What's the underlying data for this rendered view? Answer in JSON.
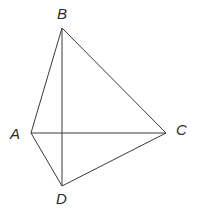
{
  "diagram": {
    "type": "geometry-figure",
    "vertices": [
      {
        "id": "A",
        "label": "A"
      },
      {
        "id": "B",
        "label": "B"
      },
      {
        "id": "C",
        "label": "C"
      },
      {
        "id": "D",
        "label": "D"
      }
    ],
    "edges": [
      {
        "from": "A",
        "to": "B"
      },
      {
        "from": "B",
        "to": "C"
      },
      {
        "from": "A",
        "to": "C"
      },
      {
        "from": "A",
        "to": "D"
      },
      {
        "from": "C",
        "to": "D"
      },
      {
        "from": "B",
        "to": "D"
      }
    ],
    "colors": {
      "line": "#3a3a3a",
      "label": "#2a2a2a",
      "background": "#ffffff"
    }
  }
}
